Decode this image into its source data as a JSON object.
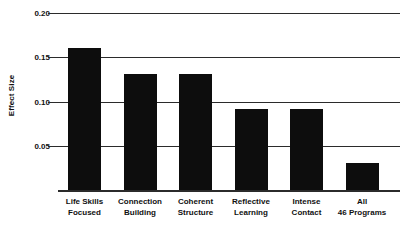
{
  "chart_data": {
    "type": "bar",
    "title": "",
    "subtitle": "",
    "xlabel": "",
    "ylabel": "Effect Size",
    "ylim": [
      0,
      0.2
    ],
    "grid": true,
    "legend": null,
    "y_ticks": [
      0.2,
      0.15,
      0.1,
      0.05
    ],
    "y_tick_labels": [
      "0.20",
      "0.15",
      "0.10",
      "0.05"
    ],
    "categories": [
      "Life Skills Focused",
      "Connection Building",
      "Coherent Structure",
      "Reflective Learning",
      "Intense Contact",
      "All 46 Programs"
    ],
    "category_lines": [
      [
        "Life Skills",
        "Focused"
      ],
      [
        "Connection",
        "Building"
      ],
      [
        "Coherent",
        "Structure"
      ],
      [
        "Reflective",
        "Learning"
      ],
      [
        "Intense",
        "Contact"
      ],
      [
        "All",
        "46 Programs"
      ]
    ],
    "values": [
      0.161,
      0.131,
      0.131,
      0.092,
      0.092,
      0.031
    ],
    "bar_color": "#0d0d0d",
    "axis_color": "#2b2b2b",
    "background_color": "#ffffff"
  },
  "axis": {
    "y_title": "Effect Size",
    "tick_0": "0.20",
    "tick_1": "0.15",
    "tick_2": "0.10",
    "tick_3": "0.05"
  },
  "x_labels": {
    "b0_l1": "Life Skills",
    "b0_l2": "Focused",
    "b1_l1": "Connection",
    "b1_l2": "Building",
    "b2_l1": "Coherent",
    "b2_l2": "Structure",
    "b3_l1": "Reflective",
    "b3_l2": "Learning",
    "b4_l1": "Intense",
    "b4_l2": "Contact",
    "b5_l1": "All",
    "b5_l2": "46 Programs"
  }
}
